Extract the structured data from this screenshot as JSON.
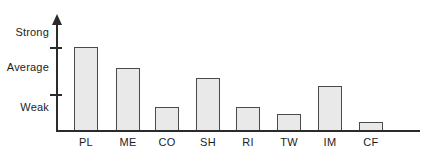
{
  "chart_data": {
    "type": "bar",
    "title": "",
    "xlabel": "",
    "ylabel": "",
    "categories": [
      "PL",
      "ME",
      "CO",
      "SH",
      "RI",
      "TW",
      "IM",
      "CF"
    ],
    "values": [
      3.0,
      2.26,
      0.85,
      1.88,
      0.85,
      0.59,
      1.6,
      0.3
    ],
    "ytick_labels": [
      "Strong",
      "Average",
      "Weak"
    ],
    "ytick_values": [
      4.0,
      2.4,
      1.0
    ],
    "ylim": [
      0,
      4.6
    ],
    "grid": false,
    "legend": false,
    "bar_fill_color": "#e9e9e9",
    "bar_edge_color": "#4a4a4a",
    "axis_color": "#2b2b2b"
  },
  "axis": {
    "y": {
      "labels": [
        {
          "text": "Strong"
        },
        {
          "text": "Average"
        },
        {
          "text": "Weak"
        }
      ]
    },
    "x": {
      "labels": [
        {
          "text": "PL"
        },
        {
          "text": "ME"
        },
        {
          "text": "CO"
        },
        {
          "text": "SH"
        },
        {
          "text": "RI"
        },
        {
          "text": "TW"
        },
        {
          "text": "IM"
        },
        {
          "text": "CF"
        }
      ]
    }
  },
  "bars": [
    {
      "label": "PL",
      "left": 74,
      "width": 24,
      "top": 47,
      "height": 83
    },
    {
      "label": "ME",
      "left": 116,
      "width": 24,
      "top": 68,
      "height": 62
    },
    {
      "label": "CO",
      "left": 155,
      "width": 24,
      "top": 107,
      "height": 23
    },
    {
      "label": "SH",
      "left": 196,
      "width": 24,
      "top": 78,
      "height": 52
    },
    {
      "label": "RI",
      "left": 236,
      "width": 24,
      "top": 107,
      "height": 23
    },
    {
      "label": "TW",
      "left": 277,
      "width": 24,
      "top": 114,
      "height": 16
    },
    {
      "label": "IM",
      "left": 318,
      "width": 24,
      "top": 86,
      "height": 44
    },
    {
      "label": "CF",
      "left": 359,
      "width": 24,
      "top": 122,
      "height": 8
    }
  ]
}
